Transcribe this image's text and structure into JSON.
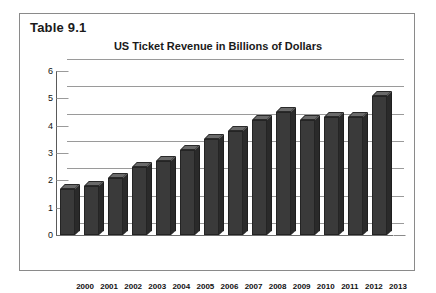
{
  "figure": {
    "caption": "Table 9.1"
  },
  "chart_data": {
    "type": "bar",
    "title": "US Ticket Revenue in Billions of Dollars",
    "xlabel": "",
    "ylabel": "",
    "ylim": [
      0,
      6
    ],
    "ytick_step": 1,
    "grid": true,
    "legend": "none",
    "style": "3d-column",
    "bar_color": "#3a3a3a",
    "gridline_color": "#9a9a9a",
    "categories": [
      "2000",
      "2001",
      "2002",
      "2003",
      "2004",
      "2005",
      "2006",
      "2007",
      "2008",
      "2009",
      "2010",
      "2011",
      "2012",
      "2013"
    ],
    "values": [
      1.7,
      1.8,
      2.1,
      2.5,
      2.7,
      3.1,
      3.5,
      3.8,
      4.2,
      4.5,
      4.2,
      4.3,
      4.3,
      5.1
    ],
    "ytick_labels": [
      "6",
      "5",
      "4",
      "3",
      "2",
      "1",
      "0"
    ]
  }
}
